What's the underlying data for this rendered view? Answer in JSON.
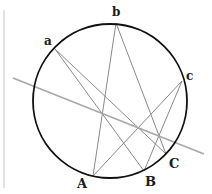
{
  "diagram": {
    "type": "geometry",
    "colors": {
      "circle": "#111111",
      "cross_lines": "#8a8a8a",
      "pascal_line": "#a8a8a8",
      "border_line": "#cfcfcf",
      "labels": "#1a1a1a"
    },
    "circle": {
      "cx": 110,
      "cy": 101,
      "r": 77
    },
    "points": [
      {
        "id": "a",
        "label": "a",
        "x": 55,
        "y": 49,
        "label_x": 44,
        "label_y": 45
      },
      {
        "id": "b",
        "label": "b",
        "x": 116,
        "y": 23,
        "label_x": 112,
        "label_y": 16
      },
      {
        "id": "c",
        "label": "c",
        "x": 182,
        "y": 81,
        "label_x": 186,
        "label_y": 80
      },
      {
        "id": "A",
        "label": "A",
        "x": 93,
        "y": 176,
        "label_x": 77,
        "label_y": 188
      },
      {
        "id": "B",
        "label": "B",
        "x": 144,
        "y": 171,
        "label_x": 145,
        "label_y": 186
      },
      {
        "id": "C",
        "label": "C",
        "x": 166,
        "y": 154,
        "label_x": 169,
        "label_y": 168
      }
    ],
    "cross_lines": [
      {
        "from": "a",
        "to": "B"
      },
      {
        "from": "a",
        "to": "C"
      },
      {
        "from": "b",
        "to": "A"
      },
      {
        "from": "b",
        "to": "C"
      },
      {
        "from": "c",
        "to": "A"
      },
      {
        "from": "c",
        "to": "B"
      }
    ],
    "pascal_line": {
      "x1": 13,
      "y1": 78,
      "x2": 204,
      "y2": 154
    },
    "border_line": {
      "x1": 4,
      "y1": 10,
      "x2": 4,
      "y2": 188
    }
  }
}
